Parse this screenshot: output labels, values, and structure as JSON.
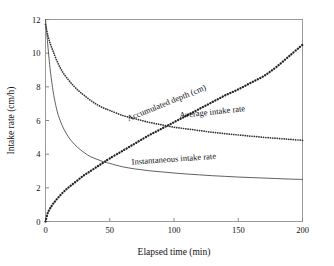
{
  "chart_data": {
    "type": "line",
    "title": "",
    "xlabel": "Elapsed time (min)",
    "ylabel": "Intake rate (cm/h)",
    "xlim": [
      0,
      200
    ],
    "ylim": [
      0,
      12
    ],
    "xticks": [
      0,
      50,
      100,
      150,
      200
    ],
    "yticks": [
      0,
      2,
      4,
      6,
      8,
      10,
      12
    ],
    "grid": false,
    "legend_position": "inline-annotations",
    "frame": "box",
    "series": [
      {
        "name": "Accumulated depth (cm)",
        "style": "dotted-thick",
        "color": "#222222",
        "label_x": 95,
        "label_y": 6.9,
        "label_rotation": -22,
        "x": [
          0,
          2,
          5,
          8,
          12,
          16,
          20,
          25,
          30,
          35,
          40,
          45,
          50,
          60,
          70,
          80,
          90,
          100,
          110,
          120,
          130,
          140,
          150,
          160,
          170,
          180,
          190,
          200
        ],
        "y": [
          0.0,
          0.55,
          0.95,
          1.25,
          1.6,
          1.9,
          2.15,
          2.45,
          2.75,
          3.0,
          3.25,
          3.5,
          3.75,
          4.2,
          4.65,
          5.1,
          5.5,
          5.9,
          6.3,
          6.7,
          7.1,
          7.5,
          7.85,
          8.25,
          8.65,
          9.2,
          9.85,
          10.5
        ]
      },
      {
        "name": "Average intake rate",
        "style": "dotted",
        "color": "#333333",
        "label_x": 130,
        "label_y": 6.35,
        "label_rotation": -6,
        "x": [
          0,
          2,
          4,
          6,
          8,
          11,
          14,
          18,
          22,
          26,
          30,
          35,
          40,
          45,
          50,
          60,
          70,
          80,
          90,
          100,
          110,
          120,
          130,
          140,
          150,
          160,
          170,
          180,
          190,
          200
        ],
        "y": [
          11.7,
          11.0,
          10.5,
          10.1,
          9.7,
          9.2,
          8.8,
          8.4,
          8.05,
          7.75,
          7.5,
          7.2,
          6.95,
          6.75,
          6.6,
          6.3,
          6.1,
          5.9,
          5.75,
          5.6,
          5.5,
          5.4,
          5.3,
          5.22,
          5.14,
          5.07,
          5.0,
          4.94,
          4.88,
          4.82
        ]
      },
      {
        "name": "Instantaneous intake rate",
        "style": "solid-thin",
        "color": "#444444",
        "label_x": 100,
        "label_y": 3.55,
        "label_rotation": -4,
        "x": [
          0,
          1,
          2,
          3,
          4,
          6,
          8,
          10,
          13,
          16,
          20,
          25,
          30,
          35,
          40,
          45,
          50,
          60,
          70,
          80,
          90,
          100,
          110,
          120,
          130,
          140,
          150,
          160,
          170,
          180,
          190,
          200
        ],
        "y": [
          12.0,
          11.2,
          10.3,
          9.5,
          8.8,
          7.7,
          6.9,
          6.3,
          5.7,
          5.25,
          4.8,
          4.4,
          4.1,
          3.85,
          3.7,
          3.55,
          3.45,
          3.25,
          3.12,
          3.02,
          2.95,
          2.88,
          2.82,
          2.77,
          2.72,
          2.68,
          2.64,
          2.61,
          2.58,
          2.55,
          2.52,
          2.5
        ]
      }
    ]
  }
}
